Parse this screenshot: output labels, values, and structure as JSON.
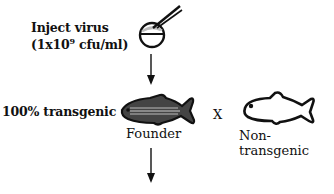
{
  "diagram": {
    "step1": {
      "label_line1": "Inject virus",
      "label_line2_prefix": "(1x10",
      "label_line2_exponent": "9",
      "label_line2_suffix": " cfu/ml)",
      "icon": "egg-injection-icon"
    },
    "step2": {
      "label": "100% transgenic",
      "founder_label": "Founder",
      "cross_symbol": "X",
      "partner_label": "Non-transgenic",
      "founder_icon": "shaded-fish-icon",
      "partner_icon": "outline-fish-icon"
    },
    "arrows": [
      "down-arrow",
      "down-arrow"
    ],
    "colors": {
      "ink": "#111111",
      "background": "#ffffff",
      "fish_fill": "#555555"
    }
  }
}
